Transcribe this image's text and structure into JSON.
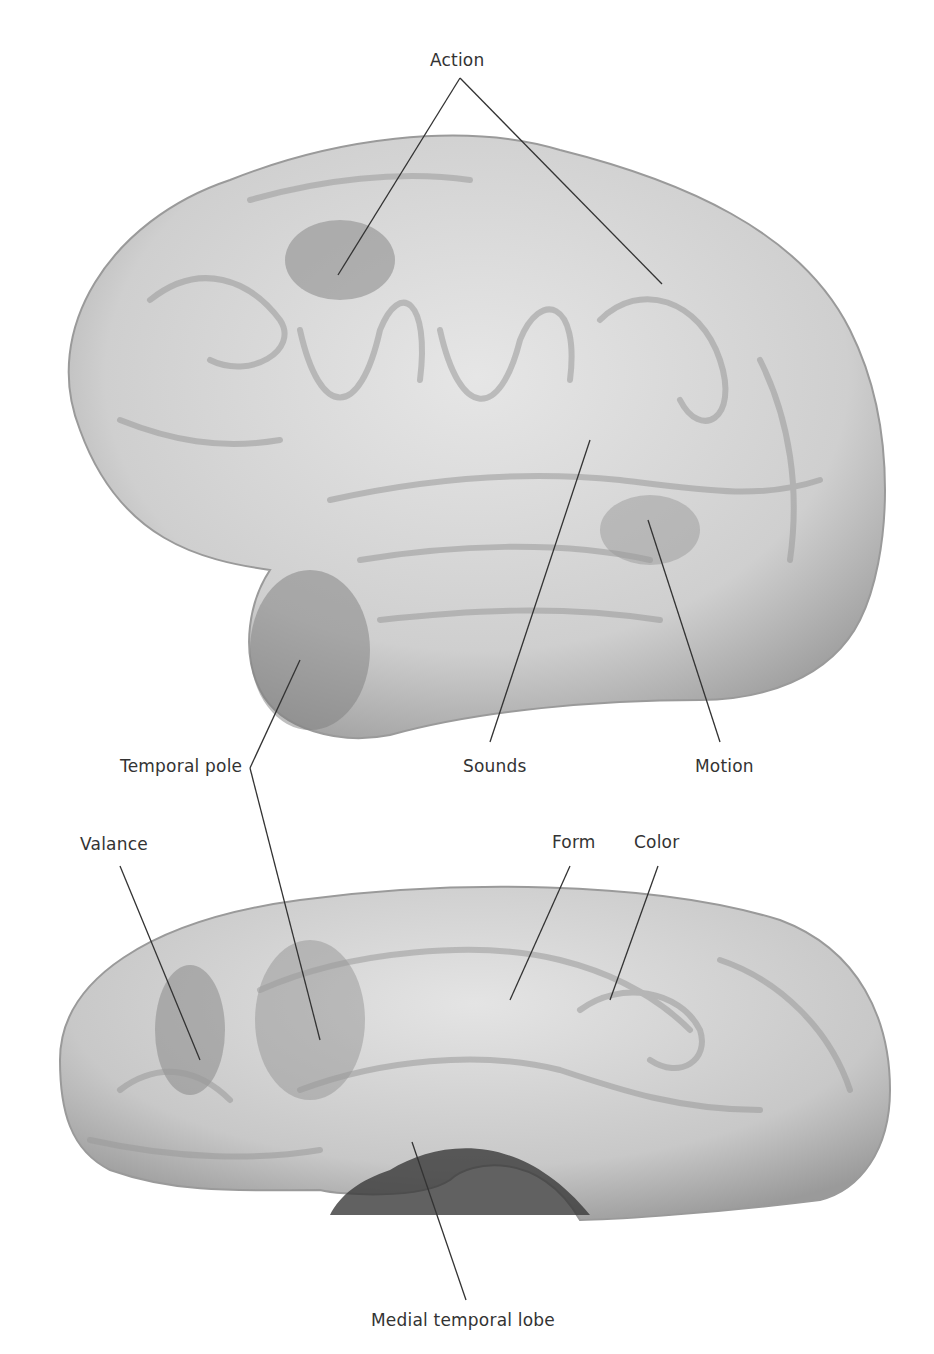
{
  "figure": {
    "views": [
      "lateral-view",
      "medial-view"
    ],
    "labels": {
      "action": "Action",
      "temporal_pole": "Temporal pole",
      "sounds": "Sounds",
      "motion": "Motion",
      "valance": "Valance",
      "form": "Form",
      "color": "Color",
      "medial_temporal_lobe": "Medial temporal lobe"
    },
    "colors": {
      "brain_base": "#d9d9d9",
      "brain_shadow": "#a6a6a6",
      "highlight_region": "#8c8c8c",
      "leader_line": "#333333",
      "label_text": "#333333"
    }
  }
}
